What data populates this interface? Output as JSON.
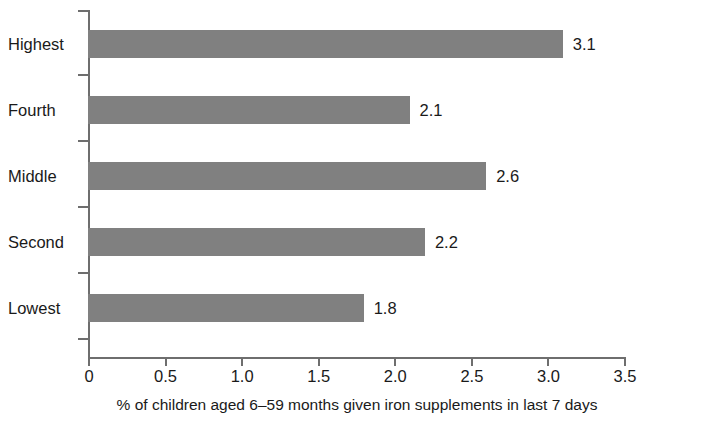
{
  "chart_data": {
    "type": "bar",
    "orientation": "horizontal",
    "title": "",
    "xlabel": "% of children aged 6–59 months given iron supplements in last 7 days",
    "ylabel": "",
    "categories": [
      "Highest",
      "Fourth",
      "Middle",
      "Second",
      "Lowest"
    ],
    "values": [
      3.1,
      2.1,
      2.6,
      2.2,
      1.8
    ],
    "value_labels": [
      "3.1",
      "2.1",
      "2.6",
      "2.2",
      "1.8"
    ],
    "xlim": [
      0,
      3.5
    ],
    "xticks": [
      0,
      0.5,
      1.0,
      1.5,
      2.0,
      2.5,
      3.0,
      3.5
    ],
    "xtick_labels": [
      "0",
      "0.5",
      "1.0",
      "1.5",
      "2.0",
      "2.5",
      "3.0",
      "3.5"
    ],
    "grid": false,
    "legend": null,
    "bar_color": "#808080",
    "axis_color": "#6e6e6e",
    "text_color": "#1a1a1a"
  },
  "caption": {
    "text": "% of children aged 6–59 months given iron supplements in last 7 days"
  }
}
